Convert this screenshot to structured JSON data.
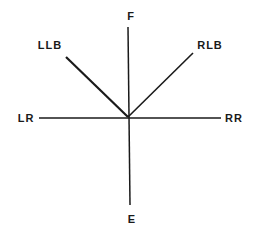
{
  "diagram": {
    "type": "direction-star",
    "center": {
      "x": 128,
      "y": 117
    },
    "colors": {
      "line": "#1a1a1a",
      "background": "#ffffff"
    },
    "labels": {
      "F": "F",
      "E": "E",
      "LLB": "LLB",
      "RLB": "RLB",
      "LR": "LR",
      "RR": "RR"
    },
    "rays": [
      {
        "id": "F",
        "label": "F",
        "end": {
          "x": 128,
          "y": 27
        }
      },
      {
        "id": "E",
        "label": "E",
        "end": {
          "x": 130,
          "y": 205
        }
      },
      {
        "id": "LLB",
        "label": "LLB",
        "end": {
          "x": 66,
          "y": 57
        }
      },
      {
        "id": "RLB",
        "label": "RLB",
        "end": {
          "x": 193,
          "y": 53
        }
      },
      {
        "id": "LR",
        "label": "LR",
        "end": {
          "x": 39,
          "y": 118
        }
      },
      {
        "id": "RR",
        "label": "RR",
        "end": {
          "x": 221,
          "y": 118
        }
      }
    ]
  }
}
